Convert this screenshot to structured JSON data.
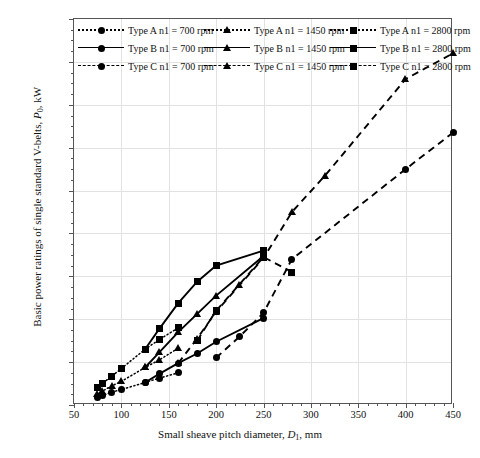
{
  "figure": {
    "xaxis_title_html": "Small sheave pitch diameter, D₁, mm",
    "yaxis_title_html": "Basic power ratings of single standard V-belts, P₀, kW"
  },
  "chart_data": {
    "type": "line",
    "title": "",
    "xlabel": "Small sheave pitch diameter, D1, mm",
    "ylabel": "Basic power ratings of single standard V-belts, P0, kW",
    "xlim": [
      50,
      450
    ],
    "ylim": [
      0,
      18
    ],
    "xticks": [
      50,
      100,
      150,
      200,
      250,
      300,
      350,
      400,
      450
    ],
    "yticks": [
      0,
      2,
      4,
      6,
      8,
      10,
      12,
      14,
      16,
      18
    ],
    "x_minor_step": 10,
    "y_minor_step": 0.5,
    "grid": true,
    "legend_position": "top-inside",
    "series": [
      {
        "name": "Type A n1 = 700 rpm",
        "type": "A",
        "rpm": 700,
        "line": "dotted",
        "marker": "circle",
        "x": [
          75,
          80,
          90,
          100,
          125,
          140,
          160
        ],
        "y": [
          0.35,
          0.45,
          0.6,
          0.72,
          1.05,
          1.25,
          1.5
        ]
      },
      {
        "name": "Type A n1 = 1450 rpm",
        "type": "A",
        "rpm": 1450,
        "line": "dotted",
        "marker": "triangle",
        "x": [
          75,
          80,
          90,
          100,
          125,
          140,
          160
        ],
        "y": [
          0.5,
          0.65,
          0.9,
          1.1,
          1.75,
          2.1,
          2.65
        ]
      },
      {
        "name": "Type A n1 = 2800 rpm",
        "type": "A",
        "rpm": 2800,
        "line": "dotted",
        "marker": "square",
        "x": [
          75,
          80,
          90,
          100,
          125,
          140,
          160
        ],
        "y": [
          0.8,
          1.0,
          1.35,
          1.7,
          2.6,
          3.05,
          3.6
        ]
      },
      {
        "name": "Type B n1 = 700 rpm",
        "type": "B",
        "rpm": 700,
        "line": "solid",
        "marker": "circle",
        "x": [
          125,
          140,
          160,
          180,
          200,
          250
        ],
        "y": [
          1.05,
          1.45,
          1.95,
          2.4,
          2.95,
          4.05
        ]
      },
      {
        "name": "Type B n1 = 1450 rpm",
        "type": "B",
        "rpm": 1450,
        "line": "solid",
        "marker": "triangle",
        "x": [
          125,
          140,
          160,
          180,
          200,
          250
        ],
        "y": [
          1.75,
          2.45,
          3.4,
          4.25,
          5.1,
          6.95
        ]
      },
      {
        "name": "Type B n1 = 2800 rpm",
        "type": "B",
        "rpm": 2800,
        "line": "solid",
        "marker": "square",
        "x": [
          125,
          140,
          160,
          180,
          200,
          250
        ],
        "y": [
          2.6,
          3.55,
          4.75,
          5.75,
          6.5,
          7.2
        ]
      },
      {
        "name": "Type C n1 = 700 rpm",
        "type": "C",
        "rpm": 700,
        "line": "dashed",
        "marker": "circle",
        "x": [
          200,
          225,
          250,
          280,
          400,
          450
        ],
        "y": [
          2.2,
          3.2,
          4.3,
          6.8,
          11.0,
          12.7
        ]
      },
      {
        "name": "Type C n1 = 1450 rpm",
        "type": "C",
        "rpm": 1450,
        "line": "dashed",
        "marker": "triangle",
        "x": [
          160,
          180,
          200,
          225,
          250,
          280,
          315,
          400,
          450
        ],
        "y": [
          1.95,
          3.1,
          4.35,
          5.6,
          6.85,
          9.0,
          10.7,
          15.2,
          16.4
        ]
      },
      {
        "name": "Type C n1 = 2800 rpm",
        "type": "C",
        "rpm": 2800,
        "line": "dashed",
        "marker": "square",
        "x": [
          180,
          200,
          250,
          280
        ],
        "y": [
          3.0,
          4.4,
          6.9,
          6.2
        ]
      }
    ]
  },
  "legend": {
    "items": [
      {
        "label": "Type A n1 = 700 rpm",
        "line": "dotted",
        "marker": "circle",
        "col": 0,
        "row": 0
      },
      {
        "label": "Type A n1 = 1450 rpm",
        "line": "dotted",
        "marker": "triangle",
        "col": 1,
        "row": 0
      },
      {
        "label": "Type A n1 = 2800 rpm",
        "line": "dotted",
        "marker": "square",
        "col": 2,
        "row": 0
      },
      {
        "label": "Type B n1 = 700 rpm",
        "line": "solid",
        "marker": "circle",
        "col": 0,
        "row": 1
      },
      {
        "label": "Type B n1 = 1450 rpm",
        "line": "solid",
        "marker": "triangle",
        "col": 1,
        "row": 1
      },
      {
        "label": "Type B n1 = 2800 rpm",
        "line": "solid",
        "marker": "square",
        "col": 2,
        "row": 1
      },
      {
        "label": "Type C n1 = 700 rpm",
        "line": "dashed",
        "marker": "circle",
        "col": 0,
        "row": 2
      },
      {
        "label": "Type C n1 = 1450 rpm",
        "line": "dashed",
        "marker": "triangle",
        "col": 1,
        "row": 2
      },
      {
        "label": "Type C n1 = 2800 rpm",
        "line": "dashed",
        "marker": "square",
        "col": 2,
        "row": 2
      }
    ]
  },
  "colors": {
    "ink": "#000000",
    "frame": "#555555",
    "grid": "#e2e2e2",
    "background": "#ffffff"
  }
}
